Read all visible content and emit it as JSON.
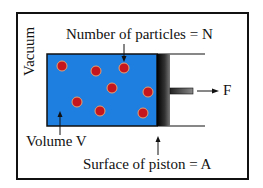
{
  "diagram": {
    "labels": {
      "vacuum": "Vacuum",
      "particles": "Number of particles = N",
      "force": "F",
      "volume": "Volume V",
      "piston_surface": "Surface of piston = A"
    },
    "colors": {
      "gas": "#1e7fe0",
      "particle": "#c4161c",
      "particle_ring": "#e8a070",
      "piston": "#1a1a1a",
      "frame": "#111111"
    },
    "particles": [
      {
        "cx": 62,
        "cy": 66
      },
      {
        "cx": 96,
        "cy": 71
      },
      {
        "cx": 124,
        "cy": 68
      },
      {
        "cx": 112,
        "cy": 88
      },
      {
        "cx": 148,
        "cy": 92
      },
      {
        "cx": 77,
        "cy": 102
      },
      {
        "cx": 100,
        "cy": 111
      },
      {
        "cx": 143,
        "cy": 113
      }
    ]
  }
}
